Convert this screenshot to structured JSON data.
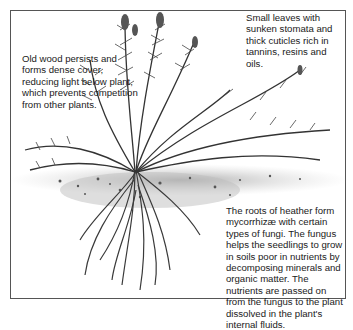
{
  "diagram": {
    "annotations": {
      "old_wood": "Old wood persists and forms dense cover, reducing light below plant, which prevents competition from other plants.",
      "leaves": "Small leaves with sunken stomata and thick cuticles rich in tannins, resins and oils.",
      "roots": "The roots of heather form mycorrhizæ with certain types of fungi. The fungus helps the seedlings to grow in soils poor in nutrients by decomposing minerals and organic matter. The nutrients are passed on from the fungus to the plant dissolved in the plant's internal fluids."
    },
    "colors": {
      "ink": "#333333",
      "soil": "#b8b8b8",
      "frame": "#555555"
    }
  }
}
